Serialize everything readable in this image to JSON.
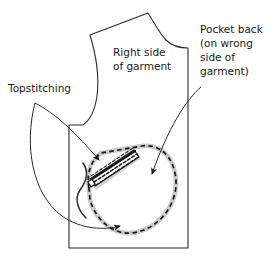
{
  "figure": {
    "type": "sewing-pattern-diagram",
    "background_color": "#ffffff",
    "ink_color": "#1a1a1a",
    "shadow_color": "#c9c9c9"
  },
  "labels": {
    "topstitching": {
      "text": "Topstitching",
      "lines": [
        "Topstitching"
      ],
      "x": 8,
      "y": 92
    },
    "right_side": {
      "text": "Right side of garment",
      "lines": [
        "Right side",
        "of garment"
      ],
      "x": 113,
      "y": 56
    },
    "pocket_back": {
      "text": "Pocket back (on wrong side of garment)",
      "lines": [
        "Pocket back",
        "(on wrong",
        "side of",
        "garment)"
      ],
      "x": 200,
      "y": 33
    }
  },
  "parts": {
    "garment_body": "garment-front-outline",
    "pocket_outline": "pocket-back-dashed-outline",
    "welt": "welt-pocket-opening",
    "topstitch_rows": "welt-topstitching-lines",
    "thread": "loose-thread-curve"
  },
  "leaders": [
    {
      "name": "topstitching-to-welt",
      "from_label": "topstitching",
      "points_to": "welt-topstitching-lines"
    },
    {
      "name": "topstitching-to-pocket-edge",
      "from_label": "topstitching",
      "points_to": "pocket-lower-edge"
    },
    {
      "name": "pocket-back-to-pocket-interior",
      "from_label": "pocket_back",
      "points_to": "pocket-back-dashed-outline"
    }
  ]
}
